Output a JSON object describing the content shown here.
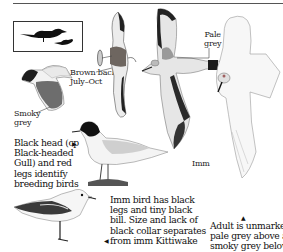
{
  "page": {
    "labels": {
      "brown_back": [
        "Brown back",
        "July–Oct"
      ],
      "smoky_grey": [
        "Smoky",
        "grey"
      ],
      "pale_grey": [
        "Pale",
        "grey"
      ],
      "imm": "Imm"
    },
    "captions": {
      "breeding": [
        "Black head (cp",
        "Black-headed",
        "Gull) and red",
        "legs identify",
        "breeding birds"
      ],
      "immature": [
        "Imm bird has black",
        "legs and tiny black",
        "bill. Size and lack of",
        "black collar separates",
        "from imm Kittiwake"
      ],
      "adult": [
        "Adult is unmarked -",
        "pale grey above and",
        "smoky grey below"
      ]
    },
    "icons": {
      "size_comparison": "bird-silhouette-icon",
      "pointer": "triangle-arrow-icon"
    },
    "colors": {
      "ink": "#1a1a1a",
      "wing_black": "#2a2a2a",
      "mantle_grey": "#9a9a9a",
      "pale_grey": "#e4e4e4",
      "brown_back": "#6e6660"
    }
  }
}
